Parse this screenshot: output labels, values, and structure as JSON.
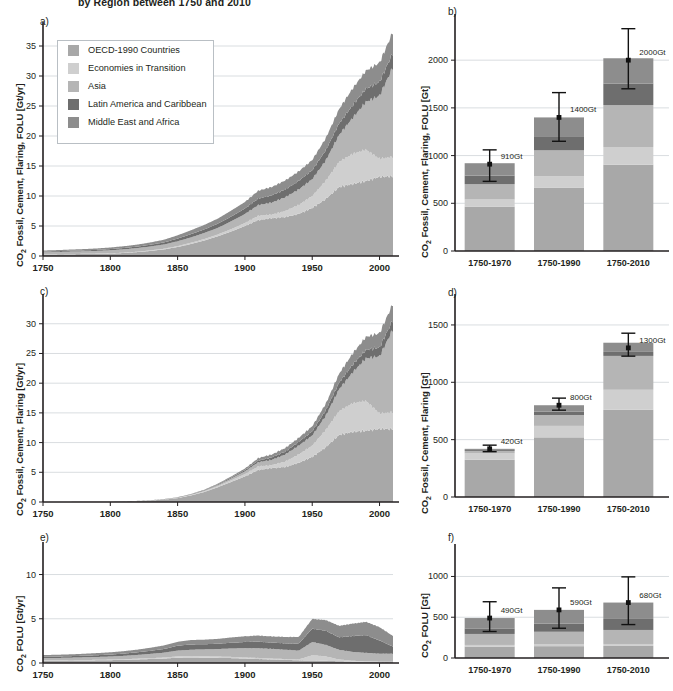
{
  "figure": {
    "title": "by Region between 1750 and 2010",
    "regions": [
      {
        "key": "oecd",
        "label": "OECD-1990 Countries",
        "color": "#a8a8a8"
      },
      {
        "key": "eit",
        "label": "Economies in Transition",
        "color": "#cfcfcf"
      },
      {
        "key": "asia",
        "label": "Asia",
        "color": "#b5b5b5"
      },
      {
        "key": "lam",
        "label": "Latin America and Caribbean",
        "color": "#6e6e6e"
      },
      {
        "key": "mea",
        "label": "Middle East and Africa",
        "color": "#8d8d8d"
      }
    ]
  },
  "legend": {
    "name": "region-legend",
    "items": [
      "OECD-1990 Countries",
      "Economies in Transition",
      "Asia",
      "Latin America and Caribbean",
      "Middle East and Africa"
    ]
  },
  "panels": {
    "a": {
      "letter": "a)",
      "ylabel_html": "CO<sub>2</sub> Fossil, Cement, Flaring, FOLU [Gt/yr]"
    },
    "b": {
      "letter": "b)",
      "ylabel_html": "CO<sub>2</sub> Fossil, Cement, Flaring, FOLU [Gt]"
    },
    "c": {
      "letter": "c)",
      "ylabel_html": "CO<sub>2</sub> Fossil, Cement, Flaring [Gt/yr]"
    },
    "d": {
      "letter": "d)",
      "ylabel_html": "CO<sub>2</sub> Fossil, Cement, Flaring [Gt]"
    },
    "e": {
      "letter": "e)",
      "ylabel_html": "CO<sub>2</sub> FOLU [Gt/yr]"
    },
    "f": {
      "letter": "f)",
      "ylabel_html": "CO<sub>2</sub> FOLU [Gt]"
    }
  },
  "chart_data": [
    {
      "id": "a",
      "type": "area",
      "title": "CO2 Fossil, Cement, Flaring, FOLU emissions by region",
      "xlabel": "",
      "ylabel": "CO2 Fossil, Cement, Flaring, FOLU [Gt/yr]",
      "xlim": [
        1750,
        2010
      ],
      "ylim": [
        0,
        38
      ],
      "yticks": [
        0,
        5,
        10,
        15,
        20,
        25,
        30,
        35
      ],
      "xticks": [
        1750,
        1800,
        1850,
        1900,
        1950,
        2000
      ],
      "grid": true,
      "stacked": true,
      "x": [
        1750,
        1760,
        1770,
        1780,
        1790,
        1800,
        1810,
        1820,
        1830,
        1840,
        1850,
        1860,
        1870,
        1880,
        1890,
        1900,
        1910,
        1920,
        1930,
        1940,
        1950,
        1960,
        1970,
        1980,
        1990,
        2000,
        2010
      ],
      "series": [
        {
          "name": "OECD-1990 Countries",
          "values": [
            0.25,
            0.27,
            0.3,
            0.33,
            0.36,
            0.4,
            0.5,
            0.65,
            0.85,
            1.1,
            1.5,
            2.0,
            2.6,
            3.3,
            4.1,
            5.0,
            6.0,
            6.3,
            6.5,
            7.0,
            8.0,
            9.5,
            11.5,
            12.0,
            12.5,
            13.2,
            13.3
          ]
        },
        {
          "name": "Economies in Transition",
          "values": [
            0.02,
            0.02,
            0.03,
            0.03,
            0.04,
            0.05,
            0.06,
            0.07,
            0.09,
            0.12,
            0.15,
            0.2,
            0.25,
            0.3,
            0.4,
            0.5,
            0.7,
            0.6,
            1.0,
            1.5,
            2.0,
            3.0,
            4.2,
            5.0,
            5.2,
            3.0,
            3.2
          ]
        },
        {
          "name": "Asia",
          "values": [
            0.35,
            0.37,
            0.4,
            0.42,
            0.45,
            0.5,
            0.55,
            0.6,
            0.65,
            0.7,
            0.8,
            0.9,
            1.0,
            1.1,
            1.3,
            1.5,
            1.8,
            2.0,
            2.3,
            2.6,
            2.8,
            3.4,
            4.5,
            6.0,
            8.0,
            10.5,
            15.0
          ]
        },
        {
          "name": "Latin America and Caribbean",
          "values": [
            0.12,
            0.13,
            0.14,
            0.15,
            0.17,
            0.2,
            0.22,
            0.25,
            0.3,
            0.35,
            0.45,
            0.55,
            0.6,
            0.7,
            0.8,
            0.9,
            1.1,
            1.2,
            1.3,
            1.4,
            1.5,
            1.7,
            1.9,
            2.1,
            2.2,
            2.3,
            2.4
          ]
        },
        {
          "name": "Middle East and Africa",
          "values": [
            0.18,
            0.19,
            0.2,
            0.22,
            0.24,
            0.27,
            0.3,
            0.33,
            0.38,
            0.45,
            0.55,
            0.65,
            0.75,
            0.85,
            1.0,
            1.1,
            1.3,
            1.4,
            1.5,
            1.6,
            1.7,
            2.0,
            2.4,
            2.8,
            3.0,
            3.2,
            3.5
          ]
        }
      ]
    },
    {
      "id": "b",
      "type": "bar",
      "title": "Cumulative CO2 Fossil, Cement, Flaring, FOLU",
      "ylabel": "CO2 Fossil, Cement, Flaring, FOLU [Gt]",
      "categories": [
        "1750-1970",
        "1750-1990",
        "1750-2010"
      ],
      "ylim": [
        0,
        2400
      ],
      "yticks": [
        0,
        500,
        1000,
        1500,
        2000
      ],
      "grid": true,
      "stacked": true,
      "totals": [
        910,
        1400,
        2000
      ],
      "total_labels": [
        "910Gt",
        "1400Gt",
        "2000Gt"
      ],
      "error_bars": [
        {
          "low": 730,
          "high": 1060
        },
        {
          "low": 1150,
          "high": 1660
        },
        {
          "low": 1700,
          "high": 2330
        }
      ],
      "series": [
        {
          "name": "OECD-1990 Countries",
          "values": [
            465,
            665,
            905
          ]
        },
        {
          "name": "Economies in Transition",
          "values": [
            75,
            120,
            185
          ]
        },
        {
          "name": "Asia",
          "values": [
            160,
            270,
            440
          ]
        },
        {
          "name": "Latin America and Caribbean",
          "values": [
            90,
            140,
            225
          ]
        },
        {
          "name": "Middle East and Africa",
          "values": [
            130,
            205,
            265
          ]
        }
      ]
    },
    {
      "id": "c",
      "type": "area",
      "title": "CO2 Fossil, Cement, Flaring emissions by region",
      "ylabel": "CO2 Fossil, Cement, Flaring [Gt/yr]",
      "xlim": [
        1750,
        2010
      ],
      "ylim": [
        0,
        34
      ],
      "yticks": [
        0,
        5,
        10,
        15,
        20,
        25,
        30
      ],
      "xticks": [
        1750,
        1800,
        1850,
        1900,
        1950,
        2000
      ],
      "grid": true,
      "stacked": true,
      "x": [
        1750,
        1760,
        1770,
        1780,
        1790,
        1800,
        1810,
        1820,
        1830,
        1840,
        1850,
        1860,
        1870,
        1880,
        1890,
        1900,
        1910,
        1920,
        1930,
        1940,
        1950,
        1960,
        1970,
        1980,
        1990,
        2000,
        2010
      ],
      "series": [
        {
          "name": "OECD-1990 Countries",
          "values": [
            0.01,
            0.02,
            0.02,
            0.03,
            0.04,
            0.05,
            0.09,
            0.15,
            0.25,
            0.4,
            0.65,
            1.1,
            1.7,
            2.5,
            3.4,
            4.3,
            5.4,
            5.7,
            5.9,
            6.6,
            7.6,
            9.2,
            11.3,
            11.8,
            12.0,
            12.3,
            12.3
          ]
        },
        {
          "name": "Economies in Transition",
          "values": [
            0.0,
            0.0,
            0.0,
            0.0,
            0.0,
            0.0,
            0.01,
            0.01,
            0.02,
            0.03,
            0.05,
            0.08,
            0.12,
            0.18,
            0.28,
            0.4,
            0.6,
            0.5,
            0.9,
            1.4,
            1.9,
            2.9,
            4.0,
            4.8,
            5.0,
            2.6,
            2.8
          ]
        },
        {
          "name": "Asia",
          "values": [
            0.0,
            0.0,
            0.0,
            0.0,
            0.0,
            0.0,
            0.01,
            0.01,
            0.02,
            0.03,
            0.05,
            0.08,
            0.12,
            0.2,
            0.3,
            0.45,
            0.7,
            0.9,
            1.2,
            1.5,
            1.7,
            2.4,
            3.7,
            5.2,
            7.2,
            9.6,
            14.0
          ]
        },
        {
          "name": "Latin America and Caribbean",
          "values": [
            0.0,
            0.0,
            0.0,
            0.0,
            0.0,
            0.0,
            0.0,
            0.01,
            0.01,
            0.02,
            0.03,
            0.05,
            0.07,
            0.1,
            0.15,
            0.2,
            0.3,
            0.4,
            0.5,
            0.6,
            0.7,
            0.9,
            1.1,
            1.3,
            1.4,
            1.5,
            1.6
          ]
        },
        {
          "name": "Middle East and Africa",
          "values": [
            0.0,
            0.0,
            0.0,
            0.0,
            0.0,
            0.0,
            0.0,
            0.01,
            0.01,
            0.02,
            0.03,
            0.05,
            0.08,
            0.12,
            0.2,
            0.28,
            0.4,
            0.5,
            0.6,
            0.7,
            0.85,
            1.1,
            1.5,
            1.9,
            2.2,
            2.4,
            2.7
          ]
        }
      ]
    },
    {
      "id": "d",
      "type": "bar",
      "title": "Cumulative CO2 Fossil, Cement, Flaring",
      "ylabel": "CO2 Fossil, Cement, Flaring [Gt]",
      "categories": [
        "1750-1970",
        "1750-1990",
        "1750-2010"
      ],
      "ylim": [
        0,
        1700
      ],
      "yticks": [
        0,
        500,
        1000,
        1500
      ],
      "grid": true,
      "stacked": true,
      "totals": [
        420,
        800,
        1300
      ],
      "total_labels": [
        "420Gt",
        "800Gt",
        "1300Gt"
      ],
      "error_bars": [
        {
          "low": 395,
          "high": 452
        },
        {
          "low": 757,
          "high": 862
        },
        {
          "low": 1228,
          "high": 1428
        }
      ],
      "series": [
        {
          "name": "OECD-1990 Countries",
          "values": [
            325,
            520,
            760
          ]
        },
        {
          "name": "Economies in Transition",
          "values": [
            55,
            100,
            175
          ]
        },
        {
          "name": "Asia",
          "values": [
            22,
            95,
            295
          ]
        },
        {
          "name": "Latin America and Caribbean",
          "values": [
            8,
            30,
            35
          ]
        },
        {
          "name": "Middle East and Africa",
          "values": [
            10,
            55,
            80
          ]
        }
      ]
    },
    {
      "id": "e",
      "type": "area",
      "title": "CO2 FOLU emissions by region",
      "ylabel": "CO2 FOLU [Gt/yr]",
      "xlim": [
        1750,
        2010
      ],
      "ylim": [
        0,
        13
      ],
      "yticks": [
        0,
        5,
        10
      ],
      "xticks": [
        1750,
        1800,
        1850,
        1900,
        1950,
        2000
      ],
      "grid": true,
      "stacked": true,
      "x": [
        1750,
        1760,
        1770,
        1780,
        1790,
        1800,
        1810,
        1820,
        1830,
        1840,
        1850,
        1860,
        1870,
        1880,
        1890,
        1900,
        1910,
        1920,
        1930,
        1940,
        1950,
        1960,
        1970,
        1980,
        1990,
        2000,
        2010
      ],
      "series": [
        {
          "name": "OECD-1990 Countries",
          "values": [
            0.25,
            0.26,
            0.27,
            0.28,
            0.3,
            0.32,
            0.35,
            0.4,
            0.45,
            0.5,
            0.6,
            0.62,
            0.6,
            0.58,
            0.55,
            0.5,
            0.45,
            0.4,
            0.35,
            0.3,
            0.28,
            0.25,
            0.2,
            0.15,
            0.12,
            0.1,
            0.1
          ]
        },
        {
          "name": "Economies in Transition",
          "values": [
            0.05,
            0.05,
            0.05,
            0.06,
            0.06,
            0.07,
            0.08,
            0.09,
            0.1,
            0.12,
            0.15,
            0.16,
            0.16,
            0.15,
            0.14,
            0.12,
            0.12,
            0.1,
            0.1,
            0.1,
            0.6,
            0.5,
            0.2,
            0.1,
            0.08,
            0.05,
            0.05
          ]
        },
        {
          "name": "Asia",
          "values": [
            0.25,
            0.26,
            0.28,
            0.3,
            0.32,
            0.34,
            0.38,
            0.42,
            0.48,
            0.55,
            0.65,
            0.72,
            0.78,
            0.85,
            0.95,
            1.05,
            1.1,
            1.1,
            1.05,
            1.0,
            1.5,
            1.3,
            1.1,
            1.0,
            0.95,
            0.9,
            0.9
          ]
        },
        {
          "name": "Latin America and Caribbean",
          "values": [
            0.15,
            0.16,
            0.17,
            0.18,
            0.2,
            0.22,
            0.25,
            0.3,
            0.35,
            0.42,
            0.55,
            0.6,
            0.58,
            0.6,
            0.65,
            0.7,
            0.75,
            0.7,
            0.72,
            0.8,
            1.5,
            1.6,
            1.4,
            1.8,
            2.0,
            1.5,
            0.8
          ]
        },
        {
          "name": "Middle East and Africa",
          "values": [
            0.2,
            0.2,
            0.21,
            0.22,
            0.24,
            0.26,
            0.28,
            0.3,
            0.35,
            0.4,
            0.45,
            0.5,
            0.52,
            0.55,
            0.6,
            0.65,
            0.68,
            0.7,
            0.72,
            0.75,
            1.1,
            1.2,
            1.3,
            1.4,
            1.5,
            1.5,
            1.2
          ]
        }
      ]
    },
    {
      "id": "f",
      "type": "bar",
      "title": "Cumulative CO2 FOLU",
      "ylabel": "CO2 FOLU [Gt]",
      "categories": [
        "1750-1970",
        "1750-1990",
        "1750-2010"
      ],
      "ylim": [
        0,
        1300
      ],
      "yticks": [
        0,
        500,
        1000
      ],
      "grid": true,
      "stacked": true,
      "totals": [
        490,
        590,
        680
      ],
      "total_labels": [
        "490Gt",
        "590Gt",
        "680Gt"
      ],
      "error_bars": [
        {
          "low": 325,
          "high": 690
        },
        {
          "low": 365,
          "high": 860
        },
        {
          "low": 410,
          "high": 995
        }
      ],
      "series": [
        {
          "name": "OECD-1990 Countries",
          "values": [
            140,
            145,
            148
          ]
        },
        {
          "name": "Economies in Transition",
          "values": [
            20,
            22,
            24
          ]
        },
        {
          "name": "Asia",
          "values": [
            135,
            155,
            172
          ]
        },
        {
          "name": "Latin America and Caribbean",
          "values": [
            68,
            100,
            135
          ]
        },
        {
          "name": "Middle East and Africa",
          "values": [
            127,
            168,
            201
          ]
        }
      ]
    }
  ]
}
